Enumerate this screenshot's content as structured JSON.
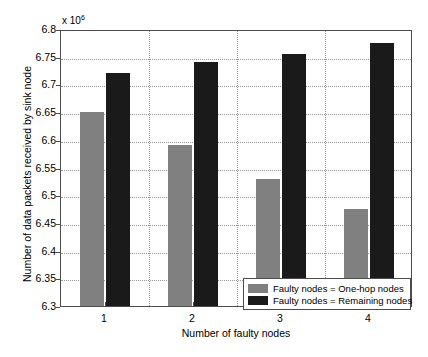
{
  "chart_data": {
    "type": "bar",
    "title": "",
    "subtitle": "",
    "xlabel": "Number of faulty nodes",
    "ylabel": "Number of data packets received by sink node",
    "exponent_label": "x 10",
    "exponent_power": "6",
    "categories": [
      "1",
      "2",
      "3",
      "4"
    ],
    "series": [
      {
        "name": "Faulty nodes = One-hop nodes",
        "color": "#808080",
        "values": [
          6.65,
          6.59,
          6.53,
          6.475
        ]
      },
      {
        "name": "Faulty nodes = Remaining nodes",
        "color": "#1a1a1a",
        "values": [
          6.72,
          6.74,
          6.755,
          6.775
        ]
      }
    ],
    "ylim": [
      6.3,
      6.8
    ],
    "ytick_labels": [
      "6.3",
      "6.35",
      "6.4",
      "6.45",
      "6.5",
      "6.55",
      "6.6",
      "6.65",
      "6.7",
      "6.75",
      "6.8"
    ],
    "ytick_values": [
      6.3,
      6.35,
      6.4,
      6.45,
      6.5,
      6.55,
      6.6,
      6.65,
      6.7,
      6.75,
      6.8
    ],
    "grid": true,
    "grid_style": "dotted",
    "legend_position": "bottom-right-inside",
    "background": "#ffffff",
    "axis_color": "#4d4d4d"
  },
  "legend": {
    "items": [
      {
        "label": "Faulty nodes = One-hop nodes"
      },
      {
        "label": "Faulty nodes = Remaining nodes"
      }
    ]
  }
}
